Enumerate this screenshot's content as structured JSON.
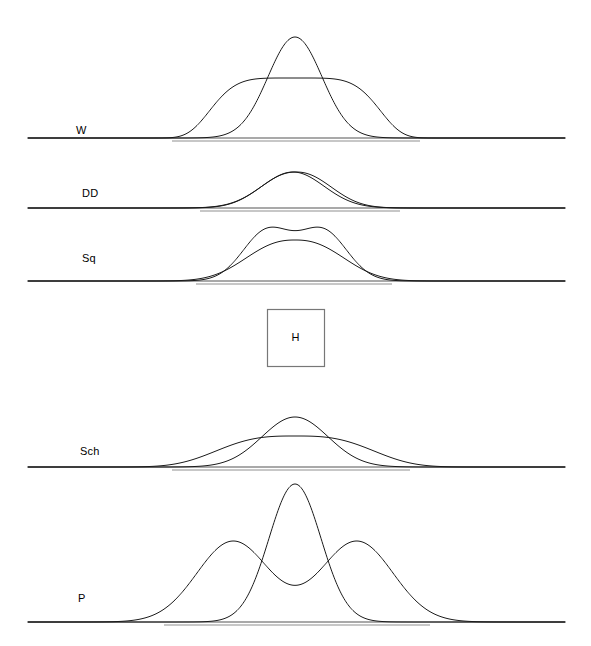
{
  "figure": {
    "width": 591,
    "height": 646,
    "background": "#ffffff",
    "curve_color": "#1a1a1a",
    "baseline_color": "#555555",
    "guide_color": "#b5b5b5",
    "box_border_color": "#777777"
  },
  "chart_data": {
    "type": "line",
    "title": "",
    "subtitle": "",
    "xlabel": "",
    "ylabel": "",
    "grid": false,
    "legend": "none",
    "axis": {
      "x_start": 28,
      "x_end": 565,
      "x_center": 295,
      "xlim": [
        28,
        565
      ],
      "ticks": [],
      "tick_labels": []
    },
    "panels": [
      {
        "label": "W",
        "label_x": 76,
        "label_y": 125,
        "baseline_y": 138,
        "guide": {
          "x_start": 172,
          "x_end": 420,
          "y": 141
        },
        "curves": [
          {
            "name": "narrow-peak",
            "shape": "gaussian",
            "center": 295,
            "sigma": 27,
            "amplitude": 101,
            "peak_y": 37
          },
          {
            "name": "flat-top",
            "shape": "super-gaussian",
            "center": 295,
            "sigma": 78,
            "exponent": 5.0,
            "amplitude": 60,
            "peak_y": 78
          }
        ]
      },
      {
        "label": "DD",
        "label_x": 82,
        "label_y": 188,
        "baseline_y": 208,
        "guide": {
          "x_start": 200,
          "x_end": 400,
          "y": 211
        },
        "curves": [
          {
            "name": "gaussian-a",
            "shape": "gaussian",
            "center": 293,
            "sigma": 31,
            "amplitude": 36,
            "peak_y": 172
          },
          {
            "name": "gaussian-b",
            "shape": "super-gaussian",
            "center": 296,
            "sigma": 34,
            "exponent": 2.2,
            "amplitude": 36,
            "peak_y": 172
          }
        ]
      },
      {
        "label": "Sq",
        "label_x": 82,
        "label_y": 253,
        "baseline_y": 281,
        "guide": {
          "x_start": 196,
          "x_end": 392,
          "y": 284
        },
        "curves": [
          {
            "name": "bimodal",
            "shape": "bimodal",
            "center": 295,
            "separation": 28,
            "sigma": 24,
            "amplitude": 53,
            "peak_y": 228,
            "dip_y": 236
          },
          {
            "name": "broad-bump",
            "shape": "super-gaussian",
            "center": 295,
            "sigma": 46,
            "exponent": 2.4,
            "amplitude": 41,
            "peak_y": 240
          }
        ]
      },
      {
        "label": "Sch",
        "label_x": 80,
        "label_y": 446,
        "baseline_y": 467,
        "guide": {
          "x_start": 172,
          "x_end": 410,
          "y": 470
        },
        "curves": [
          {
            "name": "peaked",
            "shape": "gaussian",
            "center": 295,
            "sigma": 33,
            "amplitude": 50,
            "peak_y": 417
          },
          {
            "name": "flat-top",
            "shape": "super-gaussian",
            "center": 295,
            "sigma": 72,
            "exponent": 3.0,
            "amplitude": 31,
            "peak_y": 436
          }
        ]
      },
      {
        "label": "P",
        "label_x": 78,
        "label_y": 593,
        "baseline_y": 622,
        "guide": {
          "x_start": 164,
          "x_end": 430,
          "y": 625
        },
        "curves": [
          {
            "name": "narrow-peak",
            "shape": "gaussian",
            "center": 295,
            "sigma": 26,
            "amplitude": 138,
            "peak_y": 484
          },
          {
            "name": "bimodal-wide",
            "shape": "bimodal",
            "center": 295,
            "separation": 62,
            "sigma": 36,
            "amplitude": 81,
            "peak_y": 541,
            "dip_y": 548
          }
        ]
      }
    ],
    "annotation_box": {
      "label": "H",
      "x": 267,
      "y": 309,
      "width": 57,
      "height": 57
    }
  }
}
